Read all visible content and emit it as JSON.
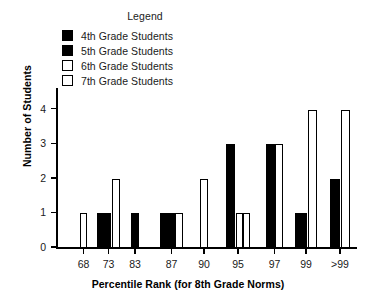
{
  "legend": {
    "title": "Legend",
    "entries": [
      {
        "label": "4th Grade Students",
        "swatch": "black"
      },
      {
        "label": "5th Grade Students",
        "swatch": "black"
      },
      {
        "label": "6th Grade Students",
        "swatch": "white"
      },
      {
        "label": "7th Grade Students",
        "swatch": "white"
      }
    ]
  },
  "chart_data": {
    "type": "bar",
    "title": "",
    "xlabel": "Percentile Rank (for 8th Grade Norms)",
    "ylabel": "Number of Students",
    "categories": [
      "68",
      "73",
      "83",
      "87",
      "90",
      "95",
      "97",
      "99",
      ">99"
    ],
    "ylim": [
      0,
      4.6
    ],
    "yticks": [
      0,
      1,
      2,
      3,
      4
    ],
    "ytick_labels": [
      "0",
      "1",
      "2",
      "3",
      "4"
    ],
    "grid": false,
    "legend_position": "top-left-outside",
    "series": [
      {
        "name": "4th Grade Students",
        "color": "#000000",
        "values": [
          0,
          0,
          0,
          0,
          0,
          0,
          0,
          0,
          0
        ]
      },
      {
        "name": "5th Grade Students",
        "color": "#000000",
        "values": [
          0,
          1,
          1,
          1,
          0,
          3,
          3,
          1,
          2
        ]
      },
      {
        "name": "6th Grade Students",
        "color": "#ffffff",
        "values": [
          1,
          2,
          0,
          1,
          2,
          1,
          3,
          0,
          0
        ]
      },
      {
        "name": "7th Grade Students",
        "color": "#ffffff",
        "values": [
          0,
          0,
          0,
          0,
          0,
          1,
          0,
          4,
          4
        ]
      }
    ],
    "bars": [
      {
        "category": "68",
        "series": "6th Grade Students",
        "value": 1,
        "fill": "white",
        "x": 80,
        "width": 7
      },
      {
        "category": "73",
        "series": "5th Grade Students",
        "value": 1,
        "fill": "black",
        "x": 97,
        "width": 14
      },
      {
        "category": "73",
        "series": "6th Grade Students",
        "value": 2,
        "fill": "white",
        "x": 112,
        "width": 8
      },
      {
        "category": "83",
        "series": "5th Grade Students",
        "value": 1,
        "fill": "black",
        "x": 131,
        "width": 8
      },
      {
        "category": "87",
        "series": "5th Grade Students",
        "value": 1,
        "fill": "black",
        "x": 160,
        "width": 15
      },
      {
        "category": "87",
        "series": "6th Grade Students",
        "value": 1,
        "fill": "white",
        "x": 175,
        "width": 8
      },
      {
        "category": "90",
        "series": "6th Grade Students",
        "value": 2,
        "fill": "white",
        "x": 200,
        "width": 8
      },
      {
        "category": "95",
        "series": "5th Grade Students",
        "value": 3,
        "fill": "black",
        "x": 226,
        "width": 9
      },
      {
        "category": "95",
        "series": "6th Grade Students",
        "value": 1,
        "fill": "white",
        "x": 236,
        "width": 7
      },
      {
        "category": "95",
        "series": "7th Grade Students",
        "value": 1,
        "fill": "white",
        "x": 243,
        "width": 7
      },
      {
        "category": "97",
        "series": "5th Grade Students",
        "value": 3,
        "fill": "black",
        "x": 266,
        "width": 9
      },
      {
        "category": "97",
        "series": "6th Grade Students",
        "value": 3,
        "fill": "white",
        "x": 275,
        "width": 8
      },
      {
        "category": "99",
        "series": "5th Grade Students",
        "value": 1,
        "fill": "black",
        "x": 295,
        "width": 12
      },
      {
        "category": "99",
        "series": "7th Grade Students",
        "value": 4,
        "fill": "white",
        "x": 308,
        "width": 9
      },
      {
        "category": ">99",
        "series": "5th Grade Students",
        "value": 2,
        "fill": "black",
        "x": 330,
        "width": 10
      },
      {
        "category": ">99",
        "series": "7th Grade Students",
        "value": 4,
        "fill": "white",
        "x": 341,
        "width": 9
      }
    ]
  }
}
